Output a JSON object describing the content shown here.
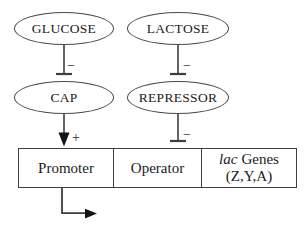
{
  "nodes": {
    "glucose": {
      "label": "GLUCOSE"
    },
    "lactose": {
      "label": "LACTOSE"
    },
    "cap": {
      "label": "CAP"
    },
    "repressor": {
      "label": "REPRESSOR"
    }
  },
  "edges": {
    "glucose_cap": {
      "type": "inhibition",
      "sign": "−"
    },
    "lactose_repressor": {
      "type": "inhibition",
      "sign": "−"
    },
    "cap_promoter": {
      "type": "activation",
      "sign": "+"
    },
    "repressor_operator": {
      "type": "inhibition",
      "sign": "−"
    }
  },
  "dna_segments": {
    "promoter": "Promoter",
    "operator": "Operator",
    "genes_italic": "lac",
    "genes_rest": "Genes",
    "genes_line2": "(Z,Y,A)"
  },
  "colors": {
    "line": "#3e3e3e",
    "arrow_fill": "#141414",
    "text": "#1a1a1a",
    "background": "#ffffff"
  }
}
